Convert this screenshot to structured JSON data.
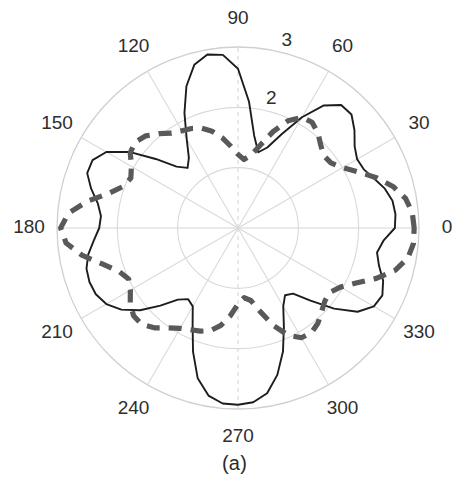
{
  "figure": {
    "caption": "(a)",
    "background_color": "#ffffff"
  },
  "chart_data": {
    "type": "line",
    "subtype": "polar",
    "title": "",
    "subtitle": "",
    "xlabel": "",
    "ylabel": "",
    "grid": true,
    "legend_position": "none",
    "center_px": {
      "x": 238,
      "y": 228
    },
    "outer_radius_px": 181,
    "angular_unit": "degrees",
    "angular_direction": "counterclockwise",
    "zero_angle_at": "east",
    "rlim": [
      0,
      3
    ],
    "radial_ticks": [
      1,
      2,
      3
    ],
    "radial_tick_labels_shown": [
      "2",
      "3"
    ],
    "radial_tick_label_angle_deg": 75,
    "angular_ticks": [
      0,
      30,
      60,
      90,
      120,
      150,
      180,
      210,
      240,
      270,
      300,
      330
    ],
    "angular_tick_labels": [
      "0",
      "30",
      "60",
      "90",
      "120",
      "150",
      "180",
      "210",
      "240",
      "270",
      "300",
      "330"
    ],
    "series": [
      {
        "name": "solid-pattern",
        "style": "solid",
        "color": "#1d1d1d",
        "line_width_px": 1.9,
        "theta": [
          0,
          5,
          10,
          15,
          20,
          25,
          30,
          35,
          40,
          45,
          50,
          55,
          60,
          65,
          70,
          75,
          80,
          85,
          90,
          95,
          100,
          105,
          110,
          115,
          120,
          125,
          130,
          135,
          140,
          145,
          150,
          155,
          160,
          165,
          170,
          175,
          180,
          185,
          190,
          195,
          200,
          205,
          210,
          215,
          220,
          225,
          230,
          235,
          240,
          245,
          250,
          255,
          260,
          265,
          270,
          275,
          280,
          285,
          290,
          295,
          300,
          305,
          310,
          315,
          320,
          325,
          330,
          335,
          340,
          345,
          350,
          355,
          360
        ],
        "r": [
          2.6,
          2.62,
          2.6,
          2.52,
          2.4,
          2.3,
          2.28,
          2.36,
          2.52,
          2.66,
          2.66,
          2.48,
          2.12,
          1.72,
          1.42,
          1.3,
          1.55,
          2.1,
          2.64,
          2.88,
          2.92,
          2.8,
          2.5,
          2.1,
          1.7,
          1.42,
          1.3,
          1.44,
          1.78,
          2.2,
          2.52,
          2.66,
          2.66,
          2.52,
          2.36,
          2.28,
          2.3,
          2.4,
          2.52,
          2.6,
          2.62,
          2.6,
          2.52,
          2.36,
          2.12,
          1.82,
          1.55,
          1.44,
          1.5,
          1.78,
          2.18,
          2.58,
          2.82,
          2.92,
          2.93,
          2.9,
          2.78,
          2.52,
          2.18,
          1.8,
          1.5,
          1.36,
          1.42,
          1.7,
          2.08,
          2.42,
          2.6,
          2.64,
          2.56,
          2.42,
          2.34,
          2.42,
          2.6
        ]
      },
      {
        "name": "dashed-pattern",
        "style": "dashed",
        "color": "#595959",
        "line_width_px": 5.2,
        "dash_pattern_px": [
          13,
          9
        ],
        "theta": [
          0,
          5,
          10,
          15,
          20,
          25,
          30,
          35,
          40,
          45,
          50,
          55,
          60,
          65,
          70,
          75,
          80,
          85,
          90,
          95,
          100,
          105,
          110,
          115,
          120,
          125,
          130,
          135,
          140,
          145,
          150,
          155,
          160,
          165,
          170,
          175,
          180,
          185,
          190,
          195,
          200,
          205,
          210,
          215,
          220,
          225,
          230,
          235,
          240,
          245,
          250,
          255,
          260,
          265,
          270,
          275,
          280,
          285,
          290,
          295,
          300,
          305,
          310,
          315,
          320,
          325,
          330,
          335,
          340,
          345,
          350,
          355,
          360
        ],
        "r": [
          2.92,
          2.9,
          2.82,
          2.66,
          2.44,
          2.2,
          2.0,
          1.88,
          1.86,
          1.94,
          2.06,
          2.14,
          2.12,
          1.96,
          1.7,
          1.42,
          1.22,
          1.14,
          1.22,
          1.36,
          1.52,
          1.66,
          1.76,
          1.82,
          1.86,
          1.92,
          2.04,
          2.16,
          2.22,
          2.18,
          2.04,
          1.96,
          2.02,
          2.22,
          2.54,
          2.82,
          2.94,
          2.86,
          2.62,
          2.32,
          2.1,
          2.0,
          2.06,
          2.18,
          2.26,
          2.26,
          2.16,
          2.02,
          1.92,
          1.86,
          1.82,
          1.76,
          1.64,
          1.46,
          1.26,
          1.16,
          1.22,
          1.44,
          1.72,
          1.96,
          2.1,
          2.12,
          2.06,
          1.96,
          1.88,
          1.86,
          1.96,
          2.16,
          2.44,
          2.7,
          2.86,
          2.92,
          2.92
        ]
      }
    ]
  }
}
